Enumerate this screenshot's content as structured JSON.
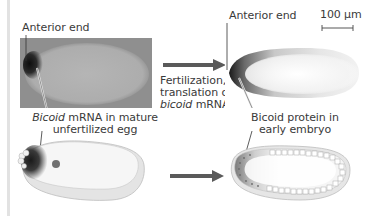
{
  "figure": {
    "scale_bar": {
      "label": "100 µm"
    },
    "top_left": {
      "label": "Anterior end"
    },
    "top_right": {
      "label": "Anterior end"
    },
    "middle_caption": {
      "line1": "Fertilization,",
      "line2": "translation of",
      "line3_italic": "bicoid",
      "line3_rest": " mRNA"
    },
    "bottom_left": {
      "line1_italic": "Bicoid",
      "line1_rest": " mRNA in mature",
      "line2": "unfertilized egg"
    },
    "bottom_right": {
      "line1": "Bicoid protein in",
      "line2": "early embryo"
    },
    "colors": {
      "arrow": "#5a5a5a",
      "photo_bg": "#8f8f8f",
      "egg_fill": "#f2f2f2",
      "stain": "#1a1a1a"
    }
  }
}
